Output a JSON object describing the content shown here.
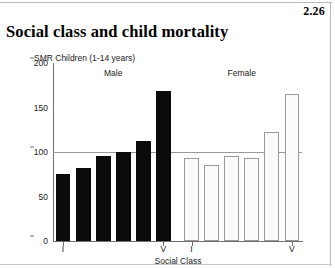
{
  "page": {
    "figure_number": "2.26",
    "title": "Social class and child mortality"
  },
  "chart_data": {
    "type": "bar",
    "title": "Social class and child mortality",
    "subtitle": "SMR  Children (1-14 years)",
    "xlabel": "Social Class",
    "ylabel": "SMR",
    "ylim": [
      0,
      200
    ],
    "yticks": [
      0,
      50,
      100,
      150,
      200
    ],
    "ytick_labels": [
      "0",
      "50",
      "100",
      "150",
      "200"
    ],
    "grid": "reference line at 100",
    "reference_line": 100,
    "legend": "none",
    "groups": [
      {
        "name": "Male",
        "label": "Male",
        "color": "#0b0b0b",
        "categories": [
          "I",
          "II",
          "IIIN",
          "IIIM",
          "IV",
          "V"
        ],
        "tick_labels": [
          "I",
          "",
          "",
          "",
          "",
          "V"
        ],
        "values": [
          75,
          82,
          95,
          100,
          112,
          168
        ]
      },
      {
        "name": "Female",
        "label": "Female",
        "color": "#fbfbfb",
        "categories": [
          "I",
          "II",
          "IIIN",
          "IIIM",
          "IV",
          "V"
        ],
        "tick_labels": [
          "I",
          "",
          "",
          "",
          "",
          "V"
        ],
        "values": [
          93,
          85,
          95,
          93,
          122,
          165
        ]
      }
    ]
  }
}
